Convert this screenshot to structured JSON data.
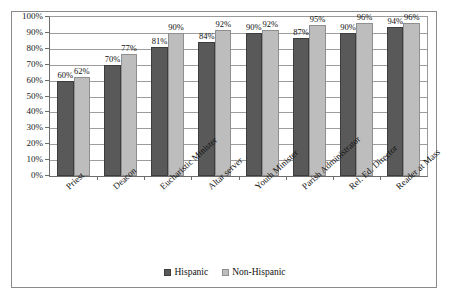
{
  "chart_data": {
    "type": "bar",
    "title": "",
    "subtitle": "",
    "xlabel": "",
    "ylabel": "",
    "ylim": [
      0,
      100
    ],
    "yticks": [
      "0%",
      "10%",
      "20%",
      "30%",
      "40%",
      "50%",
      "60%",
      "70%",
      "80%",
      "90%",
      "100%"
    ],
    "ytick_values": [
      0,
      10,
      20,
      30,
      40,
      50,
      60,
      70,
      80,
      90,
      100
    ],
    "grid": true,
    "legend_position": "bottom",
    "categories": [
      "Priest",
      "Deacon",
      "Eucharistic Minister",
      "Altar server",
      "Youth Minister",
      "Parish Administrator",
      "Rel. Ed. Director",
      "Reader at Mass"
    ],
    "series": [
      {
        "name": "Hispanic",
        "color": "#595959",
        "values": [
          60,
          70,
          81,
          84,
          90,
          87,
          90,
          94
        ],
        "labels": [
          "60%",
          "70%",
          "81%",
          "84%",
          "90%",
          "87%",
          "90%",
          "94%"
        ]
      },
      {
        "name": "Non-Hispanic",
        "color": "#bdbdbd",
        "values": [
          62,
          77,
          90,
          92,
          92,
          95,
          96,
          96
        ],
        "labels": [
          "62%",
          "77%",
          "90%",
          "92%",
          "92%",
          "95%",
          "96%",
          "96%"
        ]
      }
    ]
  },
  "legend": {
    "items": [
      {
        "label": "Hispanic",
        "swatch": "hispanic"
      },
      {
        "label": "Non-Hispanic",
        "swatch": "nonhispanic"
      }
    ]
  }
}
